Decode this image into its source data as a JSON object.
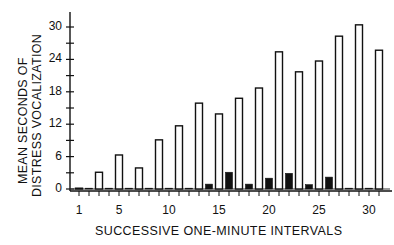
{
  "chart_data": {
    "type": "bar",
    "title": "",
    "xlabel": "SUCCESSIVE  ONE-MINUTE  INTERVALS",
    "ylabel_line1": "MEAN  SECONDS  OF",
    "ylabel_line2": "DISTRESS  VOCALIZATION",
    "ylim": [
      0,
      30
    ],
    "yticks": [
      0,
      6,
      12,
      18,
      24,
      30
    ],
    "xticks": [
      1,
      5,
      10,
      15,
      20,
      25,
      30
    ],
    "xlim": [
      1,
      31
    ],
    "grid": false,
    "legend": null,
    "x": [
      1,
      2,
      3,
      4,
      5,
      6,
      7,
      8,
      9,
      10,
      11,
      12,
      13,
      14,
      15,
      16,
      17,
      18,
      19,
      20,
      21,
      22,
      23,
      24,
      25,
      26,
      27,
      28,
      29,
      30,
      31
    ],
    "series": [
      {
        "name": "open bars (odd intervals)",
        "style": "open",
        "points": [
          {
            "x": 1,
            "y": 0.1
          },
          {
            "x": 3,
            "y": 3.1
          },
          {
            "x": 5,
            "y": 6.3
          },
          {
            "x": 7,
            "y": 3.9
          },
          {
            "x": 9,
            "y": 9.1
          },
          {
            "x": 11,
            "y": 11.7
          },
          {
            "x": 13,
            "y": 15.9
          },
          {
            "x": 15,
            "y": 13.9
          },
          {
            "x": 17,
            "y": 16.8
          },
          {
            "x": 19,
            "y": 18.7
          },
          {
            "x": 21,
            "y": 25.4
          },
          {
            "x": 23,
            "y": 21.7
          },
          {
            "x": 25,
            "y": 23.7
          },
          {
            "x": 27,
            "y": 28.3
          },
          {
            "x": 29,
            "y": 30.4
          },
          {
            "x": 31,
            "y": 25.7
          }
        ]
      },
      {
        "name": "filled bars (even intervals)",
        "style": "filled",
        "points": [
          {
            "x": 2,
            "y": 0.1
          },
          {
            "x": 4,
            "y": 0.1
          },
          {
            "x": 6,
            "y": 0.1
          },
          {
            "x": 8,
            "y": 0.1
          },
          {
            "x": 10,
            "y": 0.1
          },
          {
            "x": 12,
            "y": 0.1
          },
          {
            "x": 14,
            "y": 0.9
          },
          {
            "x": 16,
            "y": 3.1
          },
          {
            "x": 18,
            "y": 0.9
          },
          {
            "x": 20,
            "y": 2.0
          },
          {
            "x": 22,
            "y": 2.9
          },
          {
            "x": 24,
            "y": 0.8
          },
          {
            "x": 26,
            "y": 2.2
          },
          {
            "x": 28,
            "y": 0.1
          },
          {
            "x": 30,
            "y": 0.1
          }
        ]
      }
    ]
  }
}
